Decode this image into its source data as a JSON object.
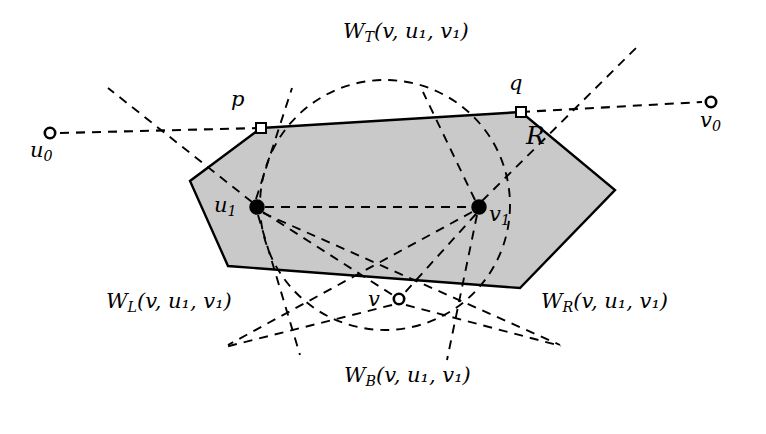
{
  "figure": {
    "kind": "geometric-diagram",
    "background_color": "#ffffff",
    "region_fill_color": "#c9c9c9",
    "region_stroke_color": "#000000",
    "dash_color": "#000000"
  },
  "labels": {
    "u0": {
      "base": "u",
      "sub": "0"
    },
    "v0": {
      "base": "v",
      "sub": "0"
    },
    "u1": {
      "base": "u",
      "sub": "1"
    },
    "v1": {
      "base": "v",
      "sub": "1"
    },
    "p": {
      "base": "p"
    },
    "q": {
      "base": "q"
    },
    "v": {
      "base": "v"
    },
    "region": {
      "base": "R"
    }
  },
  "wedges": {
    "top": {
      "name": "W",
      "sub": "T",
      "args": "(v, u₁, v₁)",
      "full": "W_T(v, u_1, v_1)"
    },
    "bottom": {
      "name": "W",
      "sub": "B",
      "args": "(v, u₁, v₁)",
      "full": "W_B(v, u_1, v_1)"
    },
    "left": {
      "name": "W",
      "sub": "L",
      "args": "(v, u₁, v₁)",
      "full": "W_L(v, u_1, v_1)"
    },
    "right": {
      "name": "W",
      "sub": "R",
      "args": "(v, u₁, v₁)",
      "full": "W_R(v, u_1, v_1)"
    }
  },
  "geometry": {
    "polygon_vertices": [
      [
        261,
        128
      ],
      [
        521,
        112
      ],
      [
        615,
        190
      ],
      [
        520,
        288
      ],
      [
        228,
        266
      ],
      [
        190,
        181
      ]
    ],
    "circle": {
      "cx": 385,
      "cy": 205,
      "r": 125
    },
    "points": {
      "u0": {
        "x": 50,
        "y": 133,
        "style": "hollow"
      },
      "v0": {
        "x": 711,
        "y": 102,
        "style": "hollow"
      },
      "u1": {
        "x": 257,
        "y": 207,
        "style": "filled"
      },
      "v1": {
        "x": 479,
        "y": 207,
        "style": "filled"
      },
      "p": {
        "x": 261,
        "y": 128,
        "style": "square"
      },
      "q": {
        "x": 521,
        "y": 112,
        "style": "square"
      },
      "v": {
        "x": 399,
        "y": 299,
        "style": "hollow"
      }
    }
  }
}
